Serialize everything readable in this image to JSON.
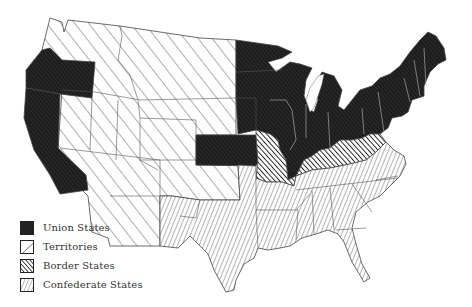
{
  "map": {
    "title": "United States, 1861",
    "regions": [
      {
        "name": "Washington Territory",
        "category": "territory"
      },
      {
        "name": "Oregon",
        "category": "union"
      },
      {
        "name": "California",
        "category": "union"
      },
      {
        "name": "Nevada",
        "category": "territory"
      },
      {
        "name": "Utah Territory",
        "category": "territory"
      },
      {
        "name": "Dakota Territory",
        "category": "territory"
      },
      {
        "name": "Nebraska Territory",
        "category": "territory"
      },
      {
        "name": "Colorado Territory",
        "category": "territory"
      },
      {
        "name": "New Mexico Territory",
        "category": "territory"
      },
      {
        "name": "Indian Territory",
        "category": "territory"
      },
      {
        "name": "Kansas",
        "category": "union"
      },
      {
        "name": "Minnesota",
        "category": "union"
      },
      {
        "name": "Iowa",
        "category": "union"
      },
      {
        "name": "Wisconsin",
        "category": "union"
      },
      {
        "name": "Illinois",
        "category": "union"
      },
      {
        "name": "Michigan",
        "category": "union"
      },
      {
        "name": "Indiana",
        "category": "union"
      },
      {
        "name": "Ohio",
        "category": "union"
      },
      {
        "name": "Pennsylvania",
        "category": "union"
      },
      {
        "name": "New York",
        "category": "union"
      },
      {
        "name": "New England",
        "category": "union"
      },
      {
        "name": "Missouri",
        "category": "border"
      },
      {
        "name": "Kentucky",
        "category": "border"
      },
      {
        "name": "West Virginia",
        "category": "border"
      },
      {
        "name": "Maryland",
        "category": "border"
      },
      {
        "name": "Texas",
        "category": "confederate"
      },
      {
        "name": "Arkansas",
        "category": "confederate"
      },
      {
        "name": "Louisiana",
        "category": "confederate"
      },
      {
        "name": "Mississippi",
        "category": "confederate"
      },
      {
        "name": "Alabama",
        "category": "confederate"
      },
      {
        "name": "Georgia",
        "category": "confederate"
      },
      {
        "name": "Florida",
        "category": "confederate"
      },
      {
        "name": "Tennessee",
        "category": "confederate"
      },
      {
        "name": "South Carolina",
        "category": "confederate"
      },
      {
        "name": "North Carolina",
        "category": "confederate"
      },
      {
        "name": "Virginia",
        "category": "confederate"
      }
    ]
  },
  "legend": {
    "items": [
      {
        "label": "Union States",
        "category": "union",
        "pattern": "dense-crosshatch-dark"
      },
      {
        "label": "Territories",
        "category": "territory",
        "pattern": "wide-diagonal-forward"
      },
      {
        "label": "Border States",
        "category": "border",
        "pattern": "medium-diagonal-forward-dark"
      },
      {
        "label": "Confederate States",
        "category": "confederate",
        "pattern": "dense-diagonal-backward"
      }
    ]
  },
  "colors": {
    "ink": "#1a1a1a",
    "paper": "#ffffff",
    "border_line": "#444444"
  }
}
